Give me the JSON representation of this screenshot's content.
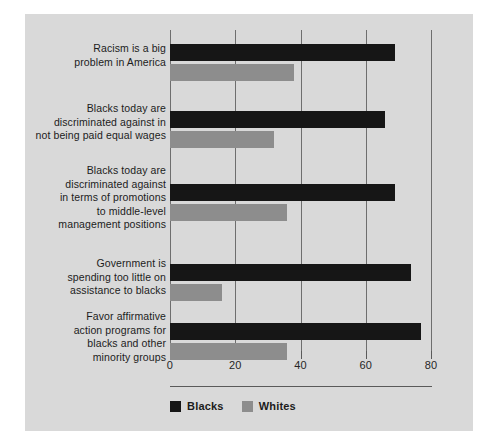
{
  "chart_data": {
    "type": "bar",
    "orientation": "horizontal",
    "title": "",
    "subtitle": "",
    "xlabel": "",
    "ylabel": "",
    "xlim": [
      0,
      80
    ],
    "xticks": [
      0,
      20,
      40,
      60,
      80
    ],
    "xticklabels": [
      "0",
      "20",
      "40",
      "60",
      "80"
    ],
    "grid": true,
    "grid_axis": "x",
    "legend_position": "bottom-left",
    "categories": [
      "Racism is a big problem in America",
      "Blacks today are discriminated against in not being paid equal wages",
      "Blacks today are discriminated against in terms of promotions to middle-level management positions",
      "Government is spending too little on assistance to blacks",
      "Favor affirmative action programs for blacks and other minority groups"
    ],
    "category_lines": [
      [
        "Racism is a big",
        "problem in America"
      ],
      [
        "Blacks today are",
        "discriminated against in",
        "not being paid equal wages"
      ],
      [
        "Blacks today are",
        "discriminated against",
        "in terms of promotions",
        "to middle-level",
        "management positions"
      ],
      [
        "Government is",
        "spending too little on",
        "assistance to blacks"
      ],
      [
        "Favor affirmative",
        "action programs for",
        "blacks and other",
        "minority groups"
      ]
    ],
    "series": [
      {
        "name": "Blacks",
        "color": "#161616",
        "values": [
          69,
          66,
          69,
          74,
          77
        ]
      },
      {
        "name": "Whites",
        "color": "#8d8d8d",
        "values": [
          38,
          32,
          36,
          16,
          36
        ]
      }
    ]
  },
  "legend": {
    "items": [
      {
        "label": "Blacks",
        "color": "#161616"
      },
      {
        "label": "Whites",
        "color": "#8d8d8d"
      }
    ]
  },
  "colors": {
    "panel_background": "#d9d9d9",
    "page_background": "#ffffff",
    "grid": "#6e6e6e",
    "text": "#1c1c1c",
    "blacks_series": "#161616",
    "whites_series": "#8d8d8d"
  }
}
